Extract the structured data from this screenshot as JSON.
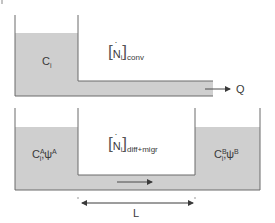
{
  "colors": {
    "fill": "#cfcfcf",
    "wall": "#6a6a6a",
    "text": "#3a3a3a",
    "arrow": "#4a4a4a"
  },
  "top_panel": {
    "reservoir_label": {
      "base": "C",
      "sub": "i"
    },
    "flux_label": {
      "base": "N",
      "sub": "i",
      "outer_sub": "conv"
    },
    "outflow_label": "Q"
  },
  "bottom_panel": {
    "left_reservoir_label": {
      "base": "C",
      "sub": "i",
      "sup": "A",
      "sep": ",",
      "psi": "ψ",
      "psi_sup": "A"
    },
    "right_reservoir_label": {
      "base": "C",
      "sub": "i",
      "sup": "B",
      "sep": ",",
      "psi": "ψ",
      "psi_sup": "B"
    },
    "flux_label": {
      "base": "N",
      "sub": "i",
      "outer_sub": "diff+migr"
    },
    "length_label": "L"
  }
}
